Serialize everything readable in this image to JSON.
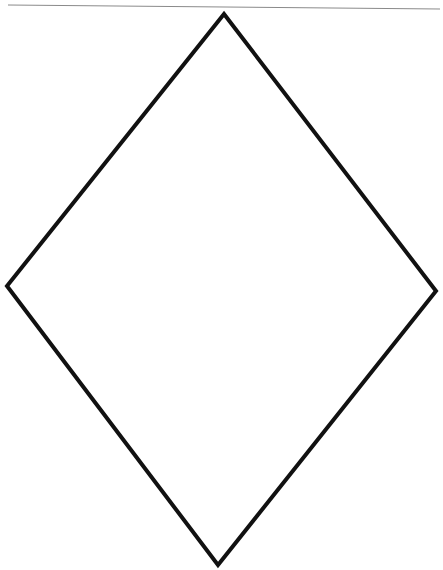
{
  "figure": {
    "background": "#ffffff",
    "top_rule": {
      "x1": 8,
      "y1": 5,
      "x2": 440,
      "y2": 9,
      "color": "#8a8a8a",
      "width": 1
    },
    "diamond": {
      "stroke": "#111111",
      "stroke_width": 4,
      "vertices": {
        "top": [
          224,
          14
        ],
        "right": [
          436,
          291
        ],
        "bottom": [
          218,
          565
        ],
        "left": [
          7,
          286
        ]
      }
    }
  }
}
